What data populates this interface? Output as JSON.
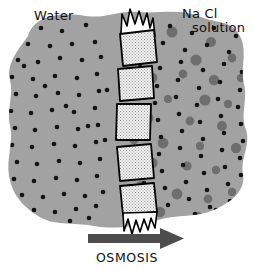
{
  "figure": {
    "title_absent": true,
    "labels": {
      "left_compartment": "Water",
      "right_compartment_line1": "Na Cl",
      "right_compartment_line2": "solution",
      "process": "OSMOSIS"
    },
    "colors": {
      "background": "#ffffff",
      "solution_fill": "#a2a2a2",
      "water_molecule_dot": "#141414",
      "solute_particle": "#6e6e6e",
      "membrane_fill": "#efefef",
      "membrane_outline": "#000000",
      "arrow": "#4d4d4d",
      "text": "#101010"
    },
    "arrow": {
      "direction": "right",
      "meaning": "net water movement from water side to NaCl solution side",
      "x_start": 88,
      "x_end": 182,
      "y": 238
    },
    "membrane": {
      "name": "semipermeable-membrane",
      "segment_count": 5,
      "texture": "stippled",
      "torn_ends": [
        "top",
        "bottom"
      ]
    },
    "chart_data": {
      "type": "diagram",
      "title": "Osmosis across a semipermeable membrane",
      "compartments": [
        {
          "name": "Water",
          "side": "left",
          "water_dots": 64,
          "solute_particles": 0
        },
        {
          "name": "Na Cl solution",
          "side": "right",
          "water_dots": 66,
          "solute_particles": 26
        }
      ]
    }
  },
  "water_dots_left": [
    [
      41,
      28
    ],
    [
      62,
      31
    ],
    [
      86,
      25
    ],
    [
      28,
      44
    ],
    [
      50,
      46
    ],
    [
      72,
      44
    ],
    [
      95,
      42
    ],
    [
      18,
      60
    ],
    [
      38,
      62
    ],
    [
      60,
      58
    ],
    [
      82,
      60
    ],
    [
      101,
      57
    ],
    [
      12,
      77
    ],
    [
      33,
      79
    ],
    [
      55,
      76
    ],
    [
      77,
      78
    ],
    [
      97,
      74
    ],
    [
      16,
      94
    ],
    [
      36,
      96
    ],
    [
      58,
      93
    ],
    [
      79,
      95
    ],
    [
      99,
      91
    ],
    [
      11,
      111
    ],
    [
      31,
      113
    ],
    [
      52,
      110
    ],
    [
      74,
      112
    ],
    [
      95,
      108
    ],
    [
      15,
      128
    ],
    [
      35,
      130
    ],
    [
      57,
      127
    ],
    [
      78,
      129
    ],
    [
      98,
      125
    ],
    [
      12,
      145
    ],
    [
      32,
      147
    ],
    [
      54,
      144
    ],
    [
      75,
      146
    ],
    [
      96,
      142
    ],
    [
      17,
      162
    ],
    [
      37,
      164
    ],
    [
      59,
      161
    ],
    [
      80,
      163
    ],
    [
      100,
      159
    ],
    [
      14,
      179
    ],
    [
      34,
      181
    ],
    [
      56,
      178
    ],
    [
      77,
      180
    ],
    [
      97,
      176
    ],
    [
      22,
      195
    ],
    [
      43,
      197
    ],
    [
      64,
      194
    ],
    [
      85,
      196
    ],
    [
      103,
      192
    ],
    [
      34,
      210
    ],
    [
      55,
      212
    ],
    [
      76,
      209
    ],
    [
      96,
      206
    ],
    [
      49,
      223
    ],
    [
      70,
      221
    ],
    [
      89,
      218
    ],
    [
      24,
      66
    ],
    [
      45,
      86
    ],
    [
      66,
      106
    ],
    [
      88,
      126
    ],
    [
      107,
      90
    ],
    [
      105,
      140
    ]
  ],
  "water_dots_right": [
    [
      148,
      30
    ],
    [
      170,
      26
    ],
    [
      192,
      33
    ],
    [
      214,
      28
    ],
    [
      236,
      36
    ],
    [
      143,
      47
    ],
    [
      163,
      43
    ],
    [
      185,
      50
    ],
    [
      207,
      45
    ],
    [
      229,
      52
    ],
    [
      140,
      64
    ],
    [
      160,
      68
    ],
    [
      181,
      62
    ],
    [
      203,
      70
    ],
    [
      224,
      64
    ],
    [
      242,
      72
    ],
    [
      137,
      81
    ],
    [
      157,
      86
    ],
    [
      178,
      80
    ],
    [
      199,
      88
    ],
    [
      220,
      82
    ],
    [
      240,
      90
    ],
    [
      134,
      98
    ],
    [
      155,
      103
    ],
    [
      176,
      97
    ],
    [
      197,
      105
    ],
    [
      218,
      99
    ],
    [
      238,
      107
    ],
    [
      137,
      115
    ],
    [
      158,
      120
    ],
    [
      179,
      114
    ],
    [
      200,
      122
    ],
    [
      221,
      116
    ],
    [
      241,
      124
    ],
    [
      140,
      132
    ],
    [
      161,
      137
    ],
    [
      182,
      131
    ],
    [
      203,
      139
    ],
    [
      224,
      133
    ],
    [
      243,
      141
    ],
    [
      138,
      149
    ],
    [
      159,
      154
    ],
    [
      180,
      148
    ],
    [
      201,
      156
    ],
    [
      222,
      150
    ],
    [
      240,
      158
    ],
    [
      141,
      166
    ],
    [
      162,
      171
    ],
    [
      183,
      165
    ],
    [
      204,
      173
    ],
    [
      225,
      167
    ],
    [
      241,
      175
    ],
    [
      144,
      183
    ],
    [
      165,
      188
    ],
    [
      186,
      182
    ],
    [
      207,
      190
    ],
    [
      228,
      184
    ],
    [
      147,
      200
    ],
    [
      168,
      205
    ],
    [
      189,
      199
    ],
    [
      210,
      207
    ],
    [
      230,
      201
    ],
    [
      153,
      216
    ],
    [
      174,
      219
    ],
    [
      195,
      214
    ],
    [
      216,
      210
    ]
  ],
  "solute_particles": [
    [
      172,
      32,
      5.5
    ],
    [
      211,
      42,
      5.0
    ],
    [
      145,
      58,
      4.6
    ],
    [
      196,
      60,
      5.6
    ],
    [
      232,
      58,
      4.4
    ],
    [
      152,
      78,
      5.4
    ],
    [
      183,
      74,
      4.4
    ],
    [
      214,
      80,
      5.2
    ],
    [
      241,
      78,
      4.2
    ],
    [
      139,
      96,
      4.8
    ],
    [
      168,
      99,
      4.0
    ],
    [
      205,
      100,
      5.6
    ],
    [
      228,
      104,
      4.2
    ],
    [
      148,
      118,
      5.4
    ],
    [
      190,
      121,
      4.4
    ],
    [
      222,
      126,
      5.0
    ],
    [
      134,
      140,
      4.4
    ],
    [
      163,
      143,
      5.4
    ],
    [
      200,
      146,
      4.2
    ],
    [
      236,
      148,
      5.2
    ],
    [
      152,
      163,
      5.6
    ],
    [
      187,
      166,
      4.6
    ],
    [
      216,
      170,
      4.2
    ],
    [
      141,
      186,
      5.0
    ],
    [
      177,
      194,
      5.4
    ],
    [
      208,
      199,
      4.4
    ],
    [
      232,
      192,
      4.2
    ],
    [
      160,
      212,
      5.2
    ],
    [
      198,
      216,
      4.0
    ]
  ]
}
